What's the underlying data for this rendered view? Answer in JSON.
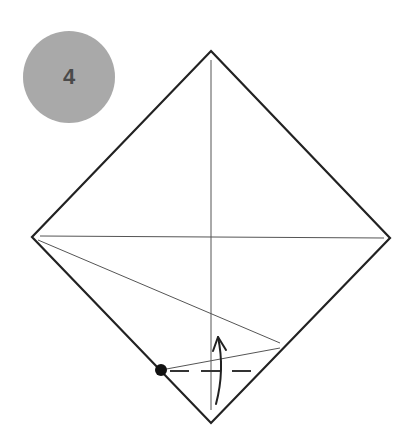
{
  "step": {
    "number": "4",
    "badge_color": "#a9a9a9",
    "number_color": "#4a4a4a"
  },
  "diagram": {
    "type": "origami-fold-step",
    "paper_outline": {
      "shape": "diamond",
      "vertices": {
        "top": [
          211,
          51
        ],
        "right": [
          390,
          238
        ],
        "bottom": [
          211,
          423
        ],
        "left": [
          32,
          237
        ]
      },
      "stroke": "#222222"
    },
    "crease_lines": [
      {
        "name": "vertical-center-crease",
        "from": [
          211,
          60
        ],
        "to": [
          211,
          410
        ]
      },
      {
        "name": "horizontal-center-crease",
        "from": [
          40,
          236
        ],
        "to": [
          384,
          238
        ]
      },
      {
        "name": "diagonal-crease-upper",
        "from": [
          38,
          240
        ],
        "to": [
          280,
          343
        ]
      },
      {
        "name": "diagonal-crease-lower",
        "from": [
          161,
          370
        ],
        "to": [
          280,
          348
        ]
      }
    ],
    "valley_fold_line": {
      "from": [
        170,
        371
      ],
      "to": [
        254,
        371
      ],
      "style": "dashed"
    },
    "reference_point": {
      "center": [
        161,
        370
      ],
      "radius": 6,
      "color": "#111111"
    },
    "fold_arrow": {
      "direction": "up",
      "tail": [
        217,
        404
      ],
      "tip": [
        218,
        336
      ]
    }
  }
}
